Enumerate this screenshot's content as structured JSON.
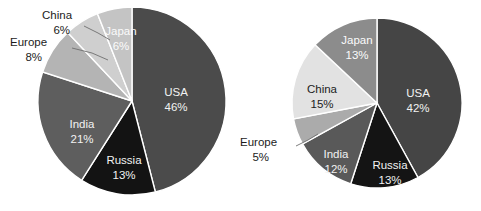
{
  "figure": {
    "background_color": "#ffffff",
    "chart_count": 2
  },
  "chart_data": [
    {
      "type": "pie",
      "title": "",
      "subtitle": "",
      "xlabel": "",
      "ylabel": "",
      "position": "left",
      "legend": "none",
      "grid": false,
      "start_angle_deg": 0,
      "direction": "clockwise",
      "center_px": [
        132,
        101
      ],
      "radius_px": 94,
      "categories": [
        "USA",
        "Russia",
        "India",
        "Europe",
        "China",
        "Japan"
      ],
      "values": [
        46,
        21,
        13,
        8,
        6,
        6
      ],
      "slices": [
        {
          "label": "USA",
          "value": 46,
          "value_text": "46%",
          "color": "#4b4b4b",
          "text_color": "#f2f2f2",
          "label_style": "inside",
          "label_px": [
            176,
            99
          ]
        },
        {
          "label": "Russia",
          "value": 13,
          "value_text": "13%",
          "color": "#131313",
          "text_color": "#f2f2f2",
          "label_style": "inside",
          "label_px": [
            124,
            167
          ]
        },
        {
          "label": "India",
          "value": 21,
          "value_text": "21%",
          "color": "#5e5e5e",
          "text_color": "#f2f2f2",
          "label_style": "inside",
          "label_px": [
            82,
            131
          ]
        },
        {
          "label": "Europe",
          "value": 8,
          "value_text": "8%",
          "color": "#b4b4b4",
          "text_color": "#1c1c1c",
          "label_style": "callout",
          "label_px": [
            38,
            48
          ]
        },
        {
          "label": "China",
          "value": 6,
          "value_text": "6%",
          "color": "#cfcfcf",
          "text_color": "#1c1c1c",
          "label_style": "callout",
          "label_px": [
            64,
            20
          ]
        },
        {
          "label": "Japan",
          "value": 6,
          "value_text": "6%",
          "color": "#c4c4c4",
          "text_color": "#fbfbfb",
          "label_style": "inside",
          "label_px": [
            121,
            38
          ]
        }
      ]
    },
    {
      "type": "pie",
      "title": "",
      "subtitle": "",
      "xlabel": "",
      "ylabel": "",
      "position": "right",
      "legend": "none",
      "grid": false,
      "start_angle_deg": 0,
      "direction": "clockwise",
      "center_px": [
        377,
        103
      ],
      "radius_px": 85,
      "categories": [
        "USA",
        "Russia",
        "India",
        "Europe",
        "China",
        "Japan"
      ],
      "values": [
        42,
        13,
        12,
        5,
        15,
        13
      ],
      "slices": [
        {
          "label": "USA",
          "value": 42,
          "value_text": "42%",
          "color": "#454545",
          "text_color": "#f2f2f2",
          "label_style": "inside",
          "label_px": [
            418,
            100
          ]
        },
        {
          "label": "Russia",
          "value": 13,
          "value_text": "13%",
          "color": "#141414",
          "text_color": "#f2f2f2",
          "label_style": "inside",
          "label_px": [
            390,
            172
          ]
        },
        {
          "label": "India",
          "value": 12,
          "value_text": "12%",
          "color": "#595959",
          "text_color": "#f2f2f2",
          "label_style": "inside",
          "label_px": [
            336,
            161
          ]
        },
        {
          "label": "Europe",
          "value": 5,
          "value_text": "5%",
          "color": "#ababab",
          "text_color": "#1c1c1c",
          "label_style": "callout",
          "label_px": [
            264,
            148
          ]
        },
        {
          "label": "China",
          "value": 15,
          "value_text": "15%",
          "color": "#e2e2e2",
          "text_color": "#1c1c1c",
          "label_style": "inside",
          "label_px": [
            322,
            96
          ]
        },
        {
          "label": "Japan",
          "value": 13,
          "value_text": "13%",
          "color": "#8c8c8c",
          "text_color": "#fbfbfb",
          "label_style": "inside",
          "label_px": [
            357,
            47
          ]
        }
      ]
    }
  ]
}
